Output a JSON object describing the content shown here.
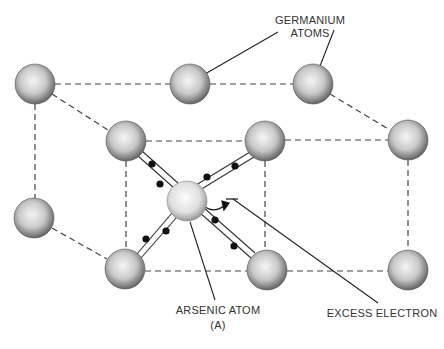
{
  "labels": {
    "germanium": {
      "line1": "GERMANIUM",
      "line2": "ATOMS"
    },
    "arsenic": {
      "line1": "ARSENIC ATOM",
      "line2": "(A)"
    },
    "excess_electron": "EXCESS ELECTRON"
  },
  "colors": {
    "atom_light": "#f4f4f4",
    "atom_dark": "#6a6a6a",
    "line": "#333333",
    "electron": "#111111"
  },
  "atoms": {
    "germanium": [
      {
        "id": "back-top-left",
        "cx": 35,
        "cy": 84
      },
      {
        "id": "back-top-middle",
        "cx": 190,
        "cy": 84
      },
      {
        "id": "back-top-right",
        "cx": 313,
        "cy": 84
      },
      {
        "id": "front-top-left",
        "cx": 126,
        "cy": 141
      },
      {
        "id": "front-top-right",
        "cx": 265,
        "cy": 141
      },
      {
        "id": "far-right-top",
        "cx": 408,
        "cy": 140
      },
      {
        "id": "back-middle-left",
        "cx": 34,
        "cy": 218
      },
      {
        "id": "front-bottom-left",
        "cx": 125,
        "cy": 269
      },
      {
        "id": "front-bottom-right",
        "cx": 267,
        "cy": 270
      },
      {
        "id": "far-right-bottom",
        "cx": 408,
        "cy": 270
      }
    ],
    "arsenic": {
      "id": "arsenic-center",
      "cx": 186,
      "cy": 201
    }
  }
}
